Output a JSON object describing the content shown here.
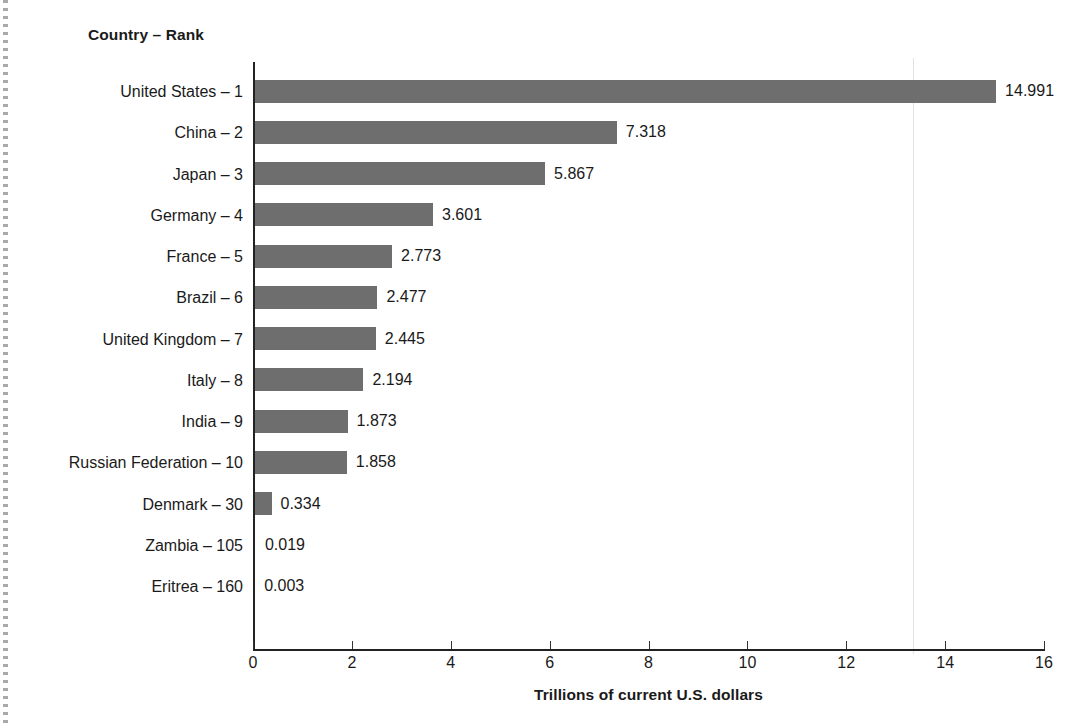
{
  "figure": {
    "column_header": "Country – Rank",
    "xlabel": "Trillions of current U.S. dollars",
    "bar_color": "#6e6e6e",
    "axis_color": "#222222"
  },
  "chart_data": {
    "type": "bar",
    "orientation": "horizontal",
    "title": "",
    "subtitle": "",
    "xlabel": "Trillions of current U.S. dollars",
    "ylabel": "Country – Rank",
    "xlim": [
      0,
      16
    ],
    "xticks": [
      0,
      2,
      4,
      6,
      8,
      10,
      12,
      14,
      16
    ],
    "xtick_labels": [
      "0",
      "2",
      "4",
      "6",
      "8",
      "10",
      "12",
      "14",
      "16"
    ],
    "grid": false,
    "legend": false,
    "value_label_format": "3 decimals",
    "categories": [
      "United States – 1",
      "China – 2",
      "Japan – 3",
      "Germany – 4",
      "France – 5",
      "Brazil – 6",
      "United Kingdom – 7",
      "Italy – 8",
      "India – 9",
      "Russian Federation  – 10",
      "Denmark – 30",
      "Zambia – 105",
      "Eritrea – 160"
    ],
    "country_names": [
      "United States",
      "China",
      "Japan",
      "Germany",
      "France",
      "Brazil",
      "United Kingdom",
      "Italy",
      "India",
      "Russian Federation",
      "Denmark",
      "Zambia",
      "Eritrea"
    ],
    "ranks": [
      1,
      2,
      3,
      4,
      5,
      6,
      7,
      8,
      9,
      10,
      30,
      105,
      160
    ],
    "values": [
      14.991,
      7.318,
      5.867,
      3.601,
      2.773,
      2.477,
      2.445,
      2.194,
      1.873,
      1.858,
      0.334,
      0.019,
      0.003
    ],
    "value_labels": [
      "14.991",
      "7.318",
      "5.867",
      "3.601",
      "2.773",
      "2.477",
      "2.445",
      "2.194",
      "1.873",
      "1.858",
      "0.334",
      "0.019",
      "0.003"
    ]
  }
}
